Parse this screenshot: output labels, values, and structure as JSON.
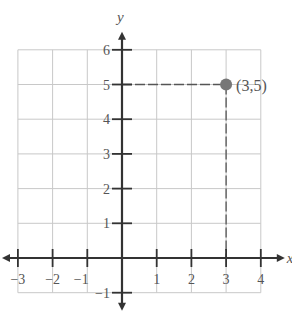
{
  "chart_data": {
    "type": "scatter",
    "title": "",
    "xlabel": "x",
    "ylabel": "y",
    "xlim": [
      -3,
      4
    ],
    "ylim": [
      -1,
      6
    ],
    "grid": true,
    "x_ticks": [
      -3,
      -2,
      -1,
      1,
      2,
      3,
      4
    ],
    "y_ticks": [
      -1,
      1,
      2,
      3,
      4,
      5,
      6
    ],
    "x_tick_labels": [
      "−3",
      "−2",
      "−1",
      "1",
      "2",
      "3",
      "4"
    ],
    "y_tick_labels": [
      "−1",
      "1",
      "2",
      "3",
      "4",
      "5",
      "6"
    ],
    "points": [
      {
        "x": 3,
        "y": 5,
        "label": "(3,5)"
      }
    ],
    "guide_lines": "dashed lines from point to each axis",
    "colors": {
      "grid": "#c8c8c8",
      "axis": "#333333",
      "point": "#777777",
      "guide": "#555555"
    }
  }
}
